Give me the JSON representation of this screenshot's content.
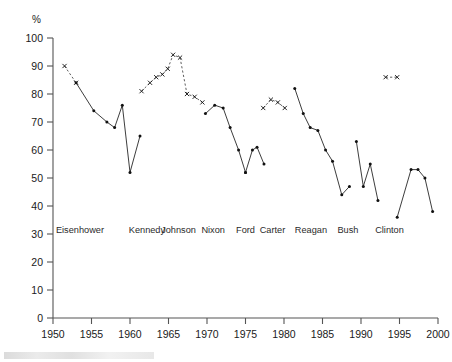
{
  "chart_data": {
    "type": "line",
    "title": "",
    "subtitle": "",
    "xlabel": "",
    "ylabel": "%",
    "ylim": [
      0,
      100
    ],
    "xlim": [
      1950,
      2000
    ],
    "grid": false,
    "legend_position": "none",
    "y_ticks": [
      0,
      10,
      20,
      30,
      40,
      50,
      60,
      70,
      80,
      90,
      100
    ],
    "x_ticks": [
      1950,
      1955,
      1960,
      1965,
      1970,
      1975,
      1980,
      1985,
      1990,
      1995,
      2000
    ],
    "era_labels": [
      {
        "name": "Eisenhower",
        "x": 1953.5
      },
      {
        "name": "Kennedy",
        "x": 1962.2
      },
      {
        "name": "Johnson",
        "x": 1966.3
      },
      {
        "name": "Nixon",
        "x": 1970.8
      },
      {
        "name": "Ford",
        "x": 1975.0
      },
      {
        "name": "Carter",
        "x": 1978.5
      },
      {
        "name": "Reagan",
        "x": 1983.5
      },
      {
        "name": "Bush",
        "x": 1988.3
      },
      {
        "name": "Clinton",
        "x": 1993.7
      }
    ],
    "series": [
      {
        "name": "Eisenhower",
        "style": "dashed",
        "marker": "x",
        "x": [
          1951.5,
          1953.0
        ],
        "values": [
          90,
          84
        ]
      },
      {
        "name": "Eisenhower-solid",
        "style": "solid",
        "marker": "dot",
        "x": [
          1953.0,
          1955.3,
          1957.0,
          1958.0,
          1959.0,
          1960.0,
          1961.3
        ],
        "values": [
          84,
          74,
          70,
          68,
          76,
          52,
          65
        ]
      },
      {
        "name": "Kennedy-Johnson",
        "style": "dashed",
        "marker": "x",
        "x": [
          1961.5,
          1962.6,
          1963.4,
          1964.2,
          1964.9,
          1965.6,
          1966.5,
          1967.4,
          1968.4,
          1969.4
        ],
        "values": [
          81,
          84,
          86,
          87,
          89,
          94,
          93,
          80,
          79,
          77
        ]
      },
      {
        "name": "Nixon",
        "style": "solid",
        "marker": "dot",
        "x": [
          1969.8,
          1971.0,
          1972.1,
          1973.0,
          1974.1,
          1975.0
        ],
        "values": [
          73,
          76,
          75,
          68,
          60,
          52
        ]
      },
      {
        "name": "Ford",
        "style": "solid",
        "marker": "dot",
        "x": [
          1975.0,
          1975.9,
          1976.5,
          1977.4
        ],
        "values": [
          52,
          60,
          61,
          55
        ]
      },
      {
        "name": "Carter",
        "style": "dashed",
        "marker": "x",
        "x": [
          1977.3,
          1978.3,
          1979.2,
          1980.1
        ],
        "values": [
          75,
          78,
          77,
          75
        ]
      },
      {
        "name": "Reagan",
        "style": "solid",
        "marker": "dot",
        "x": [
          1981.4,
          1982.5,
          1983.4,
          1984.4,
          1985.4,
          1986.3,
          1987.5,
          1988.5
        ],
        "values": [
          82,
          73,
          68,
          67,
          60,
          56,
          44,
          47
        ]
      },
      {
        "name": "Bush",
        "style": "solid",
        "marker": "dot",
        "x": [
          1989.4,
          1990.3,
          1991.2,
          1992.2
        ],
        "values": [
          63,
          47,
          55,
          42
        ]
      },
      {
        "name": "Clinton-top",
        "style": "dashed",
        "marker": "x",
        "x": [
          1993.2,
          1994.7
        ],
        "values": [
          86,
          86
        ]
      },
      {
        "name": "Clinton",
        "style": "solid",
        "marker": "dot",
        "x": [
          1994.7,
          1996.5,
          1997.4,
          1998.3,
          1999.3
        ],
        "values": [
          36,
          53,
          53,
          50,
          38
        ]
      }
    ]
  }
}
